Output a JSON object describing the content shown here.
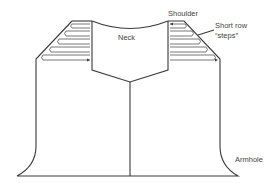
{
  "diagram": {
    "labels": {
      "neck": "Neck",
      "shoulder": "Shoulder",
      "short_row_line1": "Short row",
      "short_row_line2": "“steps”",
      "armhole": "Armhole"
    },
    "colors": {
      "line": "#3a3a3a",
      "text": "#444444",
      "background": "#ffffff"
    },
    "short_row_steps_per_side": 5
  }
}
